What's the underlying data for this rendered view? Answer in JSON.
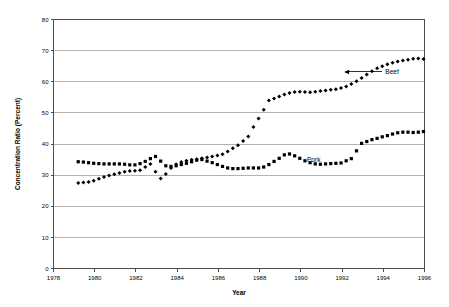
{
  "chart_data": {
    "type": "scatter",
    "title": "",
    "xlabel": "Year",
    "ylabel": "Concentration Ratio (Percent)",
    "xlim": [
      1978,
      1996
    ],
    "ylim": [
      0,
      80
    ],
    "xticks": [
      1978,
      1980,
      1982,
      1984,
      1986,
      1988,
      1990,
      1992,
      1994,
      1996
    ],
    "yticks": [
      0,
      10,
      20,
      30,
      40,
      50,
      60,
      70,
      80
    ],
    "grid": "horizontal",
    "legend_position": "inline-annotation",
    "annotations": [
      {
        "label": "Beef",
        "x": 1994.1,
        "y": 62.5,
        "arrow": true,
        "arrow_to_x": 1992.1,
        "arrow_to_y": 62.5
      },
      {
        "label": "Pork",
        "x": 1990.3,
        "y": 34.2,
        "arrow": false
      }
    ],
    "series": [
      {
        "name": "Beef",
        "marker": "diamond",
        "color": "#000000",
        "points": [
          [
            1979.2,
            27.5
          ],
          [
            1979.45,
            27.6
          ],
          [
            1979.7,
            27.8
          ],
          [
            1979.95,
            28.2
          ],
          [
            1980.2,
            28.8
          ],
          [
            1980.45,
            29.4
          ],
          [
            1980.7,
            29.9
          ],
          [
            1980.95,
            30.3
          ],
          [
            1981.2,
            30.7
          ],
          [
            1981.45,
            31.1
          ],
          [
            1981.7,
            31.3
          ],
          [
            1981.95,
            31.4
          ],
          [
            1982.2,
            31.6
          ],
          [
            1982.45,
            32.6
          ],
          [
            1982.7,
            33.6
          ],
          [
            1982.95,
            31.1
          ],
          [
            1983.2,
            28.9
          ],
          [
            1983.45,
            30.4
          ],
          [
            1983.7,
            32.3
          ],
          [
            1983.95,
            33.5
          ],
          [
            1984.2,
            34.2
          ],
          [
            1984.45,
            34.6
          ],
          [
            1984.7,
            34.9
          ],
          [
            1984.95,
            35.1
          ],
          [
            1985.2,
            35.4
          ],
          [
            1985.45,
            35.7
          ],
          [
            1985.7,
            36.0
          ],
          [
            1985.95,
            36.3
          ],
          [
            1986.2,
            36.7
          ],
          [
            1986.45,
            37.6
          ],
          [
            1986.7,
            38.6
          ],
          [
            1986.95,
            39.6
          ],
          [
            1987.2,
            41.0
          ],
          [
            1987.45,
            42.4
          ],
          [
            1987.7,
            45.5
          ],
          [
            1987.95,
            48.2
          ],
          [
            1988.2,
            51.0
          ],
          [
            1988.45,
            54.0
          ],
          [
            1988.7,
            54.6
          ],
          [
            1988.95,
            55.3
          ],
          [
            1989.2,
            55.9
          ],
          [
            1989.45,
            56.4
          ],
          [
            1989.7,
            56.7
          ],
          [
            1989.95,
            56.8
          ],
          [
            1990.2,
            56.7
          ],
          [
            1990.45,
            56.6
          ],
          [
            1990.7,
            56.8
          ],
          [
            1990.95,
            57.0
          ],
          [
            1991.2,
            57.2
          ],
          [
            1991.45,
            57.4
          ],
          [
            1991.7,
            57.6
          ],
          [
            1991.95,
            58.0
          ],
          [
            1992.2,
            58.5
          ],
          [
            1992.45,
            59.3
          ],
          [
            1992.7,
            60.2
          ],
          [
            1992.95,
            61.2
          ],
          [
            1993.2,
            62.3
          ],
          [
            1993.45,
            63.4
          ],
          [
            1993.7,
            64.3
          ],
          [
            1993.95,
            65.0
          ],
          [
            1994.2,
            65.6
          ],
          [
            1994.45,
            66.1
          ],
          [
            1994.7,
            66.5
          ],
          [
            1994.95,
            66.8
          ],
          [
            1995.2,
            67.1
          ],
          [
            1995.45,
            67.4
          ],
          [
            1995.7,
            67.5
          ],
          [
            1995.95,
            67.3
          ],
          [
            1996.2,
            67.2
          ]
        ]
      },
      {
        "name": "Pork",
        "marker": "square",
        "color": "#000000",
        "points": [
          [
            1979.2,
            34.3
          ],
          [
            1979.45,
            34.2
          ],
          [
            1979.7,
            34.0
          ],
          [
            1979.95,
            33.8
          ],
          [
            1980.2,
            33.7
          ],
          [
            1980.45,
            33.6
          ],
          [
            1980.7,
            33.6
          ],
          [
            1980.95,
            33.6
          ],
          [
            1981.2,
            33.6
          ],
          [
            1981.45,
            33.5
          ],
          [
            1981.7,
            33.3
          ],
          [
            1981.95,
            33.3
          ],
          [
            1982.2,
            33.7
          ],
          [
            1982.45,
            34.4
          ],
          [
            1982.7,
            35.3
          ],
          [
            1982.95,
            36.0
          ],
          [
            1983.2,
            34.5
          ],
          [
            1983.45,
            33.0
          ],
          [
            1983.7,
            32.8
          ],
          [
            1983.95,
            33.0
          ],
          [
            1984.2,
            33.4
          ],
          [
            1984.45,
            33.8
          ],
          [
            1984.7,
            34.3
          ],
          [
            1984.95,
            34.8
          ],
          [
            1985.2,
            35.0
          ],
          [
            1985.45,
            34.5
          ],
          [
            1985.7,
            34.0
          ],
          [
            1985.95,
            33.4
          ],
          [
            1986.2,
            32.8
          ],
          [
            1986.45,
            32.3
          ],
          [
            1986.7,
            32.1
          ],
          [
            1986.95,
            32.1
          ],
          [
            1987.2,
            32.2
          ],
          [
            1987.45,
            32.3
          ],
          [
            1987.7,
            32.3
          ],
          [
            1987.95,
            32.3
          ],
          [
            1988.2,
            32.6
          ],
          [
            1988.45,
            33.4
          ],
          [
            1988.7,
            34.4
          ],
          [
            1988.95,
            35.4
          ],
          [
            1989.2,
            36.5
          ],
          [
            1989.45,
            36.8
          ],
          [
            1989.7,
            36.2
          ],
          [
            1989.95,
            35.4
          ],
          [
            1990.2,
            34.6
          ],
          [
            1990.45,
            34.0
          ],
          [
            1990.7,
            33.6
          ],
          [
            1990.95,
            33.5
          ],
          [
            1991.2,
            33.6
          ],
          [
            1991.45,
            33.7
          ],
          [
            1991.7,
            33.8
          ],
          [
            1991.95,
            33.9
          ],
          [
            1992.2,
            34.6
          ],
          [
            1992.45,
            35.3
          ],
          [
            1992.7,
            37.8
          ],
          [
            1992.95,
            40.2
          ],
          [
            1993.2,
            40.8
          ],
          [
            1993.45,
            41.4
          ],
          [
            1993.7,
            41.8
          ],
          [
            1993.95,
            42.3
          ],
          [
            1994.2,
            42.7
          ],
          [
            1994.45,
            43.2
          ],
          [
            1994.7,
            43.6
          ],
          [
            1994.95,
            43.8
          ],
          [
            1995.2,
            43.8
          ],
          [
            1995.45,
            43.7
          ],
          [
            1995.7,
            43.8
          ],
          [
            1995.95,
            44.0
          ],
          [
            1996.2,
            44.2
          ],
          [
            1996.45,
            44.5
          ],
          [
            1996.7,
            45.0
          ],
          [
            1996.95,
            45.3
          ]
        ]
      }
    ]
  }
}
